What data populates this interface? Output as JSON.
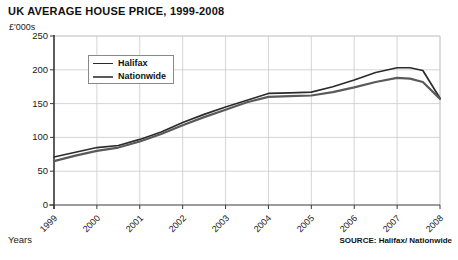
{
  "chart_data": {
    "type": "line",
    "title": "UK AVERAGE HOUSE PRICE, 1999-2008",
    "xlabel": "Years",
    "ylabel": "£'000s",
    "ylim": [
      0,
      250
    ],
    "yticks": [
      0,
      50,
      100,
      150,
      200,
      250
    ],
    "ytick_labels": [
      "0",
      "50",
      "100",
      "150",
      "200",
      "250"
    ],
    "grid": true,
    "legend_position": "top-left-inside",
    "source": "SOURCE: Halifax/ Nationwide",
    "categories": [
      "1999",
      "2000",
      "2001",
      "2002",
      "2003",
      "2004",
      "2005",
      "2006",
      "2007",
      "2008"
    ],
    "x": [
      1999,
      2000,
      2001,
      2002,
      2003,
      2004,
      2005,
      2006,
      2007,
      2008
    ],
    "series": [
      {
        "name": "Halifax",
        "color": "#2b2b2b",
        "values": [
          71,
          85,
          97,
          122,
          145,
          165,
          167,
          185,
          203,
          158
        ],
        "dense_x": [
          1999,
          1999.5,
          2000,
          2000.5,
          2001,
          2001.5,
          2002,
          2002.5,
          2003,
          2003.5,
          2004,
          2004.5,
          2005,
          2005.5,
          2006,
          2006.5,
          2007,
          2007.3,
          2007.6,
          2008
        ],
        "dense_values": [
          71,
          78,
          85,
          88,
          97,
          108,
          122,
          134,
          145,
          155,
          165,
          166,
          167,
          175,
          185,
          196,
          203,
          203,
          199,
          158
        ]
      },
      {
        "name": "Nationwide",
        "color": "#5a5a5a",
        "values": [
          65,
          80,
          94,
          118,
          141,
          160,
          162,
          174,
          188,
          157
        ],
        "dense_x": [
          1999,
          1999.5,
          2000,
          2000.5,
          2001,
          2001.5,
          2002,
          2002.5,
          2003,
          2003.5,
          2004,
          2004.5,
          2005,
          2005.5,
          2006,
          2006.5,
          2007,
          2007.3,
          2007.6,
          2008
        ],
        "dense_values": [
          65,
          73,
          80,
          85,
          94,
          105,
          118,
          130,
          141,
          152,
          160,
          161,
          162,
          167,
          174,
          182,
          188,
          187,
          182,
          157
        ]
      }
    ]
  },
  "legend": {
    "items": [
      {
        "label": "Halifax"
      },
      {
        "label": "Nationwide"
      }
    ]
  },
  "footer": {
    "source": "SOURCE: Halifax/ Nationwide",
    "years_label": "Years"
  }
}
